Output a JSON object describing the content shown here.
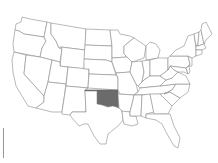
{
  "map": {
    "title": "United States",
    "highlighted_state": "Oklahoma",
    "colors": {
      "background": "#ffffff",
      "state_fill": "#ffffff",
      "state_border": "#8a8a8a",
      "highlight_fill": "#6b6b6b"
    },
    "states": [
      {
        "id": "WA",
        "name": "Washington",
        "highlighted": false
      },
      {
        "id": "OR",
        "name": "Oregon",
        "highlighted": false
      },
      {
        "id": "CA",
        "name": "California",
        "highlighted": false
      },
      {
        "id": "ID",
        "name": "Idaho",
        "highlighted": false
      },
      {
        "id": "NV",
        "name": "Nevada",
        "highlighted": false
      },
      {
        "id": "MT",
        "name": "Montana",
        "highlighted": false
      },
      {
        "id": "WY",
        "name": "Wyoming",
        "highlighted": false
      },
      {
        "id": "UT",
        "name": "Utah",
        "highlighted": false
      },
      {
        "id": "AZ",
        "name": "Arizona",
        "highlighted": false
      },
      {
        "id": "CO",
        "name": "Colorado",
        "highlighted": false
      },
      {
        "id": "NM",
        "name": "New Mexico",
        "highlighted": false
      },
      {
        "id": "ND",
        "name": "North Dakota",
        "highlighted": false
      },
      {
        "id": "SD",
        "name": "South Dakota",
        "highlighted": false
      },
      {
        "id": "NE",
        "name": "Nebraska",
        "highlighted": false
      },
      {
        "id": "KS",
        "name": "Kansas",
        "highlighted": false
      },
      {
        "id": "OK",
        "name": "Oklahoma",
        "highlighted": true
      },
      {
        "id": "TX",
        "name": "Texas",
        "highlighted": false
      },
      {
        "id": "MN",
        "name": "Minnesota",
        "highlighted": false
      },
      {
        "id": "IA",
        "name": "Iowa",
        "highlighted": false
      },
      {
        "id": "MO",
        "name": "Missouri",
        "highlighted": false
      },
      {
        "id": "AR",
        "name": "Arkansas",
        "highlighted": false
      },
      {
        "id": "LA",
        "name": "Louisiana",
        "highlighted": false
      },
      {
        "id": "WI",
        "name": "Wisconsin",
        "highlighted": false
      },
      {
        "id": "IL",
        "name": "Illinois",
        "highlighted": false
      },
      {
        "id": "MI",
        "name": "Michigan",
        "highlighted": false
      },
      {
        "id": "IN",
        "name": "Indiana",
        "highlighted": false
      },
      {
        "id": "OH",
        "name": "Ohio",
        "highlighted": false
      },
      {
        "id": "KY",
        "name": "Kentucky",
        "highlighted": false
      },
      {
        "id": "TN",
        "name": "Tennessee",
        "highlighted": false
      },
      {
        "id": "MS",
        "name": "Mississippi",
        "highlighted": false
      },
      {
        "id": "AL",
        "name": "Alabama",
        "highlighted": false
      },
      {
        "id": "GA",
        "name": "Georgia",
        "highlighted": false
      },
      {
        "id": "FL",
        "name": "Florida",
        "highlighted": false
      },
      {
        "id": "SC",
        "name": "South Carolina",
        "highlighted": false
      },
      {
        "id": "NC",
        "name": "North Carolina",
        "highlighted": false
      },
      {
        "id": "VA",
        "name": "Virginia",
        "highlighted": false
      },
      {
        "id": "WV",
        "name": "West Virginia",
        "highlighted": false
      },
      {
        "id": "PA",
        "name": "Pennsylvania",
        "highlighted": false
      },
      {
        "id": "NY",
        "name": "New York",
        "highlighted": false
      },
      {
        "id": "VT",
        "name": "Vermont",
        "highlighted": false
      },
      {
        "id": "NH",
        "name": "New Hampshire",
        "highlighted": false
      },
      {
        "id": "ME",
        "name": "Maine",
        "highlighted": false
      },
      {
        "id": "MA",
        "name": "Massachusetts",
        "highlighted": false
      },
      {
        "id": "CT",
        "name": "Connecticut",
        "highlighted": false
      },
      {
        "id": "NJ",
        "name": "New Jersey",
        "highlighted": false
      },
      {
        "id": "MD",
        "name": "Maryland",
        "highlighted": false
      },
      {
        "id": "DE",
        "name": "Delaware",
        "highlighted": false
      }
    ]
  }
}
